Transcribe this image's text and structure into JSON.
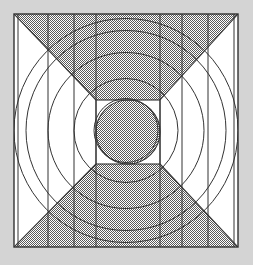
{
  "figure": {
    "background_color": "#d4d4d4",
    "paper_color": "#ffffff",
    "stroke_color": "#333333",
    "fill_pattern_color": "#555555",
    "fill_pattern_name": "checker-hatch",
    "canvas": {
      "width": 253,
      "height": 265
    },
    "square": {
      "name": "outer-square-frame",
      "x": 14,
      "y": 14,
      "width": 224,
      "height": 233,
      "stroke_width": 1.4
    },
    "center": {
      "x": 126,
      "y": 130.5
    },
    "circles": [
      {
        "name": "circle-1-innermost",
        "r": 32
      },
      {
        "name": "circle-2",
        "r": 52
      },
      {
        "name": "circle-3",
        "r": 78
      },
      {
        "name": "circle-4",
        "r": 100
      },
      {
        "name": "circle-5-outermost",
        "r": 112
      }
    ],
    "vertical_lines": [
      {
        "name": "vline-left-outer",
        "x": 18
      },
      {
        "name": "vline-left-mid",
        "x": 48
      },
      {
        "name": "vline-left-inner",
        "x": 74
      },
      {
        "name": "vline-center-left",
        "x": 96
      },
      {
        "name": "vline-center-right",
        "x": 160
      },
      {
        "name": "vline-right-inner",
        "x": 182
      },
      {
        "name": "vline-right-mid",
        "x": 208
      },
      {
        "name": "vline-right-outer",
        "x": 234
      }
    ],
    "inner_square": {
      "name": "inner-square",
      "x": 96,
      "y": 100,
      "width": 64,
      "height": 64
    },
    "center_disc": {
      "name": "center-disc",
      "cx": 128,
      "cy": 132,
      "r": 32,
      "filled": true
    },
    "sectors": [
      {
        "name": "top-bowtie-sector",
        "filled": true,
        "description": "Shaded wedge from top-left and top-right square corners converging to inner square top edge"
      },
      {
        "name": "bottom-bowtie-sector",
        "filled": true,
        "description": "Shaded wedge from bottom-left and bottom-right square corners converging to inner square bottom edge"
      }
    ],
    "diagonals": [
      {
        "name": "diagonal-top-left",
        "x1": 14,
        "y1": 14,
        "x2": 96,
        "y2": 100
      },
      {
        "name": "diagonal-top-right",
        "x1": 238,
        "y1": 14,
        "x2": 160,
        "y2": 100
      },
      {
        "name": "diagonal-bottom-left",
        "x1": 14,
        "y1": 247,
        "x2": 96,
        "y2": 164
      },
      {
        "name": "diagonal-bottom-right",
        "x1": 238,
        "y1": 247,
        "x2": 160,
        "y2": 164
      }
    ]
  }
}
